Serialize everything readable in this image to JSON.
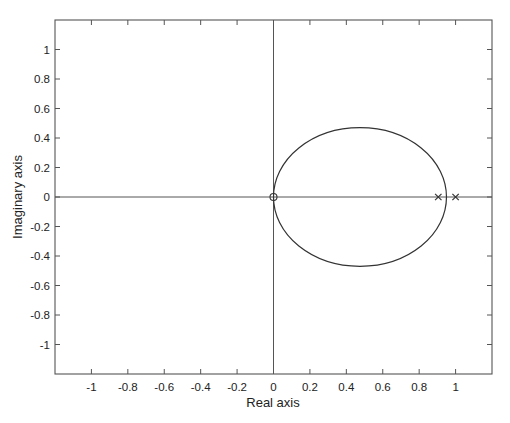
{
  "chart_data": {
    "type": "scatter",
    "title": "",
    "subtitle": "Root locus / pole-zero map",
    "xlabel": "Real axis",
    "ylabel": "Imaginary axis",
    "xlim": [
      -1.2,
      1.2
    ],
    "ylim": [
      -1.2,
      1.2
    ],
    "grid": false,
    "legend": null,
    "x_ticks": [
      -1,
      -0.8,
      -0.6,
      -0.4,
      -0.2,
      0,
      0.2,
      0.4,
      0.6,
      0.8,
      1
    ],
    "x_tick_labels": [
      "-1",
      "-0.8",
      "-0.6",
      "-0.4",
      "-0.2",
      "0",
      "0.2",
      "0.4",
      "0.6",
      "0.8",
      "1"
    ],
    "y_ticks": [
      1,
      0.8,
      0.6,
      0.4,
      0.2,
      0,
      -0.2,
      -0.4,
      -0.6,
      -0.8,
      -1
    ],
    "y_tick_labels": [
      "1",
      "0.8",
      "0.6",
      "0.4",
      "0.2",
      "0",
      "-0.2",
      "-0.4",
      "-0.6",
      "-0.8",
      "-1"
    ],
    "series": [
      {
        "name": "zeros",
        "marker": "o",
        "points": [
          {
            "re": 0,
            "im": 0
          }
        ]
      },
      {
        "name": "poles",
        "marker": "x",
        "points": [
          {
            "re": 0.905,
            "im": 0
          },
          {
            "re": 1.0,
            "im": 0
          }
        ]
      },
      {
        "name": "locus",
        "marker": "line",
        "shape": "ellipse",
        "center": {
          "re": 0.475,
          "im": 0
        },
        "radius_re": 0.475,
        "radius_im": 0.47
      }
    ],
    "reference_lines": [
      {
        "orientation": "horizontal",
        "value": 0
      },
      {
        "orientation": "vertical",
        "value": 0
      }
    ]
  }
}
